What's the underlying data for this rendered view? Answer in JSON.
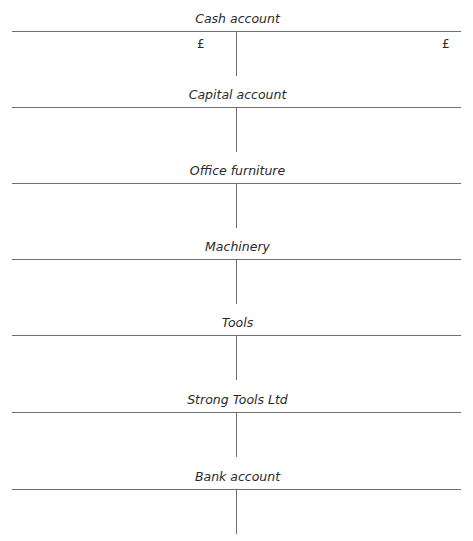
{
  "document": {
    "currency_symbol": "£",
    "accounts": [
      {
        "title": "Cash account",
        "debit_header": "£",
        "credit_header": "£"
      },
      {
        "title": "Capital account"
      },
      {
        "title": "Office furniture"
      },
      {
        "title": "Machinery"
      },
      {
        "title": "Tools"
      },
      {
        "title": "Strong Tools Ltd"
      },
      {
        "title": "Bank account"
      }
    ]
  }
}
